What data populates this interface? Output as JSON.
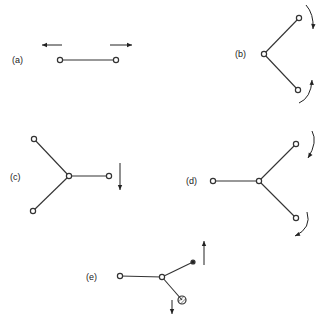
{
  "diagram": {
    "panels": [
      {
        "id": "a",
        "label": "(a)",
        "label_pos": [
          12,
          63
        ],
        "nodes": [
          [
            60,
            60
          ],
          [
            116,
            60
          ]
        ],
        "bonds": [
          [
            0,
            1
          ]
        ],
        "arrows": [
          {
            "type": "straight",
            "from": [
              62,
              45
            ],
            "to": [
              42,
              45
            ]
          },
          {
            "type": "straight",
            "from": [
              110,
              45
            ],
            "to": [
              132,
              45
            ]
          }
        ]
      },
      {
        "id": "b",
        "label": "(b)",
        "label_pos": [
          235,
          57
        ],
        "nodes": [
          [
            264,
            54
          ],
          [
            299,
            18
          ],
          [
            298,
            90
          ]
        ],
        "bonds": [
          [
            0,
            1
          ],
          [
            0,
            2
          ]
        ],
        "arrows": [
          {
            "type": "curved",
            "path": "M306 5 Q314 14 313 29",
            "head_at": [
              313,
              29
            ],
            "dir": "down"
          },
          {
            "type": "curved",
            "path": "M299 103 Q311 98 312 80",
            "head_at": [
              312,
              80
            ],
            "dir": "up"
          }
        ]
      },
      {
        "id": "c",
        "label": "(c)",
        "label_pos": [
          10,
          180
        ],
        "nodes": [
          [
            69,
            176
          ],
          [
            34,
            139
          ],
          [
            33,
            211
          ],
          [
            109,
            176
          ]
        ],
        "bonds": [
          [
            0,
            1
          ],
          [
            0,
            2
          ],
          [
            0,
            3
          ]
        ],
        "arrows": [
          {
            "type": "straight",
            "from": [
              120,
              163
            ],
            "to": [
              120,
              190
            ]
          }
        ]
      },
      {
        "id": "d",
        "label": "(d)",
        "label_pos": [
          186,
          184
        ],
        "nodes": [
          [
            213,
            181
          ],
          [
            259,
            181
          ],
          [
            296,
            144
          ],
          [
            296,
            218
          ]
        ],
        "bonds": [
          [
            0,
            1
          ],
          [
            1,
            2
          ],
          [
            1,
            3
          ]
        ],
        "arrows": [
          {
            "type": "curved",
            "path": "M312 131 Q318 142 308 158",
            "head_at": [
              308,
              158
            ],
            "dir": "down"
          },
          {
            "type": "curved",
            "path": "M307 212 Q312 228 295 236",
            "head_at": [
              295,
              236
            ],
            "dir": "down-left"
          }
        ]
      },
      {
        "id": "e",
        "label": "(e)",
        "label_pos": [
          86,
          280
        ],
        "nodes": [
          [
            120,
            276
          ],
          [
            162,
            277
          ],
          [
            193,
            262
          ],
          [
            182,
            300
          ]
        ],
        "node_styles": [
          "open",
          "open",
          "filled-small",
          "hatched-large"
        ],
        "bonds": [
          [
            0,
            1
          ],
          [
            1,
            2
          ],
          [
            1,
            3
          ]
        ],
        "arrows": [
          {
            "type": "straight",
            "from": [
              204,
              265
            ],
            "to": [
              204,
              241
            ]
          },
          {
            "type": "straight",
            "from": [
              172,
              300
            ],
            "to": [
              172,
              314
            ]
          }
        ]
      }
    ]
  }
}
